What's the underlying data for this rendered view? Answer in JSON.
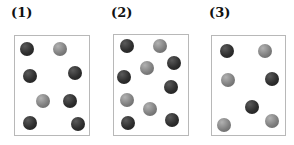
{
  "panels": [
    {
      "label": "(1)",
      "label_pos": [
        11,
        5
      ],
      "box": {
        "x": 14,
        "y": 35,
        "w": 76,
        "h": 101
      },
      "particles": [
        {
          "type": "dark",
          "x": 27,
          "y": 49
        },
        {
          "type": "light",
          "x": 60,
          "y": 49
        },
        {
          "type": "dark",
          "x": 30,
          "y": 76
        },
        {
          "type": "dark",
          "x": 75,
          "y": 73
        },
        {
          "type": "light",
          "x": 43,
          "y": 101
        },
        {
          "type": "dark",
          "x": 70,
          "y": 101
        },
        {
          "type": "dark",
          "x": 30,
          "y": 123
        },
        {
          "type": "dark",
          "x": 78,
          "y": 124
        }
      ]
    },
    {
      "label": "(2)",
      "label_pos": [
        111,
        5
      ],
      "box": {
        "x": 113,
        "y": 34,
        "w": 76,
        "h": 102
      },
      "particles": [
        {
          "type": "dark",
          "x": 127,
          "y": 46
        },
        {
          "type": "light",
          "x": 160,
          "y": 46
        },
        {
          "type": "dark",
          "x": 174,
          "y": 63
        },
        {
          "type": "light",
          "x": 147,
          "y": 68
        },
        {
          "type": "dark",
          "x": 124,
          "y": 77
        },
        {
          "type": "dark",
          "x": 171,
          "y": 87
        },
        {
          "type": "light",
          "x": 127,
          "y": 100
        },
        {
          "type": "light",
          "x": 150,
          "y": 109
        },
        {
          "type": "dark",
          "x": 128,
          "y": 123
        },
        {
          "type": "dark",
          "x": 172,
          "y": 120
        }
      ]
    },
    {
      "label": "(3)",
      "label_pos": [
        209,
        5
      ],
      "box": {
        "x": 211,
        "y": 35,
        "w": 75,
        "h": 101
      },
      "particles": [
        {
          "type": "dark",
          "x": 227,
          "y": 51
        },
        {
          "type": "light",
          "x": 265,
          "y": 51
        },
        {
          "type": "light",
          "x": 228,
          "y": 80
        },
        {
          "type": "dark",
          "x": 272,
          "y": 79
        },
        {
          "type": "dark",
          "x": 252,
          "y": 107
        },
        {
          "type": "light",
          "x": 224,
          "y": 125
        },
        {
          "type": "light",
          "x": 272,
          "y": 121
        }
      ]
    }
  ],
  "legend_colors": {
    "dark": "#2e2e2e",
    "light": "#808080"
  }
}
